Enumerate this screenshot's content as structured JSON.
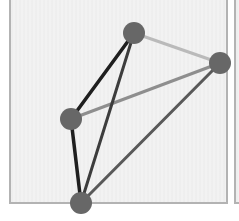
{
  "figure": {
    "panel_count_visible": 2
  },
  "colors": {
    "page_bg": "#ffffff",
    "panel_bg": "#f2f2f2",
    "panel_border": "#b3b3b3",
    "node_fill": "#676767"
  },
  "chart_data": {
    "type": "graph",
    "title": "",
    "node_radius": 11,
    "nodes": [
      {
        "id": "top",
        "x": 134,
        "y": 33
      },
      {
        "id": "right",
        "x": 220,
        "y": 63
      },
      {
        "id": "left",
        "x": 71,
        "y": 119
      },
      {
        "id": "bottom",
        "x": 81,
        "y": 203
      }
    ],
    "edges": [
      {
        "from": "top",
        "to": "right",
        "color": "#bababa",
        "width": 3
      },
      {
        "from": "left",
        "to": "right",
        "color": "#8e8e8e",
        "width": 3
      },
      {
        "from": "bottom",
        "to": "right",
        "color": "#595959",
        "width": 3
      },
      {
        "from": "top",
        "to": "bottom",
        "color": "#3d3d3d",
        "width": 3
      },
      {
        "from": "top",
        "to": "left",
        "color": "#1f1f1f",
        "width": 3.5
      },
      {
        "from": "left",
        "to": "bottom",
        "color": "#1f1f1f",
        "width": 3.5
      }
    ]
  }
}
